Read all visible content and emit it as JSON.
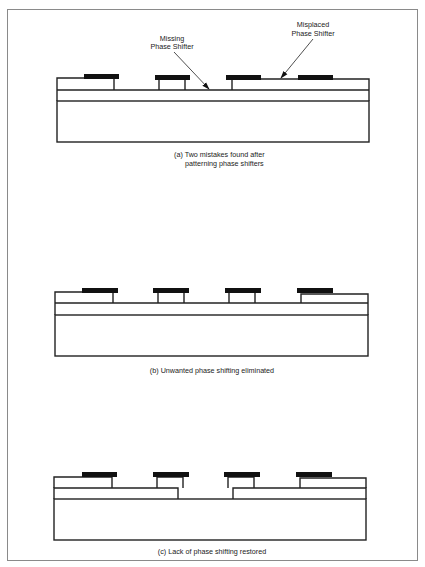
{
  "figure": {
    "panels": [
      {
        "id": "a",
        "caption_line1": "(a)  Two mistakes found after",
        "caption_line2": "patterning phase shifters",
        "annotations": [
          {
            "line1": "Missing",
            "line2": "Phase Shifter"
          },
          {
            "line1": "Misplaced",
            "line2": "Phase Shifter"
          }
        ]
      },
      {
        "id": "b",
        "caption_line1": "(b) Unwanted phase shifting eliminated"
      },
      {
        "id": "c",
        "caption_line1": "(c) Lack of phase shifting restored"
      }
    ],
    "colors": {
      "line": "#222222",
      "shifter": "#111111",
      "frame": "#8a8a8a",
      "background": "#ffffff"
    }
  }
}
